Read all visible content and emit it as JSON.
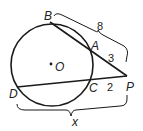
{
  "diagram": {
    "type": "geometry",
    "circle": {
      "center_label": "O",
      "cx": 52,
      "cy": 65,
      "r": 41
    },
    "points": {
      "B": {
        "label": "B",
        "x": 50,
        "y": 22
      },
      "A": {
        "label": "A",
        "x": 91,
        "y": 51
      },
      "P": {
        "label": "P",
        "x": 127,
        "y": 76
      },
      "C": {
        "label": "C",
        "x": 89,
        "y": 80
      },
      "D": {
        "label": "D",
        "x": 17,
        "y": 87
      },
      "O": {
        "label": "O",
        "x": 52,
        "y": 65
      }
    },
    "segments": [
      {
        "from": "B",
        "to": "P"
      },
      {
        "from": "D",
        "to": "P"
      }
    ],
    "measures": {
      "PB": "8",
      "PA": "3",
      "PC": "2",
      "PD": "x"
    },
    "colors": {
      "stroke": "#1a1a1a",
      "text": "#222222"
    }
  }
}
